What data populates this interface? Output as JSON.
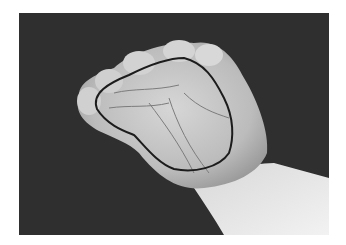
{
  "image": {
    "subject": "Grayscale photograph of a cupped hand, palm facing viewer, with a dark outline drawn around the palm region",
    "colors": {
      "background": "#2e2e2e",
      "skin_light": "#e4e4e4",
      "skin_mid": "#bdbdbd",
      "skin_shadow": "#8a8a8a",
      "outline": "#1c1c1c",
      "page": "#ffffff"
    }
  }
}
